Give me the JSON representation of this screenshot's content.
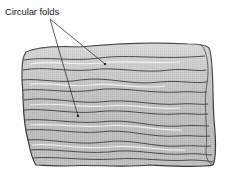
{
  "figure": {
    "label": "Circular folds",
    "colors": {
      "background": "#ffffff",
      "tissue_fill": "#c9c9c9",
      "tissue_light": "#dedede",
      "fold_line": "#4a4a4a",
      "outline": "#3a3a3a",
      "leader_line": "#333333",
      "label_text": "#222222"
    },
    "leader_lines": [
      {
        "from": [
          50,
          19
        ],
        "to": [
          105,
          64
        ]
      },
      {
        "from": [
          50,
          19
        ],
        "to": [
          78,
          116
        ]
      }
    ]
  }
}
